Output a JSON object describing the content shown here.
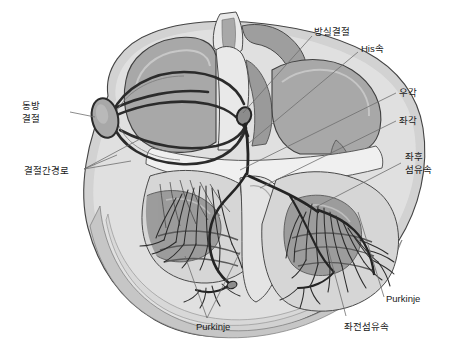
{
  "figure": {
    "width": 458,
    "height": 358,
    "background_color": "#ffffff",
    "style": "grayscale medical illustration"
  },
  "colors": {
    "background": "#ffffff",
    "outer_myocardium": "#d2d2d2",
    "mid_myocardium": "#c0c0c0",
    "endocardium_light": "#e8e8e8",
    "chamber_gray": "#a8a8a8",
    "chamber_dark": "#8f8f8f",
    "muscle_dark": "#9a9a9a",
    "outline": "#3a3a3a",
    "conduction_fiber": "#2b2b2b",
    "leader_line": "#6e6e6e",
    "label_text": "#1a1a1a"
  },
  "labels": [
    {
      "id": "sa-node",
      "text_line1": "동방",
      "text_line2": "결절",
      "x": 22,
      "y": 103,
      "align": "left",
      "leader_to_x": 95,
      "leader_to_y": 117
    },
    {
      "id": "internodal-pathway",
      "text_line1": "결절간경로",
      "text_line2": "",
      "x": 24,
      "y": 168,
      "align": "left",
      "leader_to_x": 130,
      "leader_to_y": 152
    },
    {
      "id": "av-node",
      "text_line1": "방실결절",
      "text_line2": "",
      "x": 314,
      "y": 27,
      "align": "left",
      "leader_to_x": 243,
      "leader_to_y": 113
    },
    {
      "id": "his-bundle",
      "text_line1": "His속",
      "text_line2": "",
      "x": 361,
      "y": 44,
      "align": "left",
      "leader_to_x": 248,
      "leader_to_y": 140
    },
    {
      "id": "right-bundle-branch",
      "text_line1": "우각",
      "text_line2": "",
      "x": 399,
      "y": 88,
      "align": "left",
      "leader_to_x": 243,
      "leader_to_y": 168
    },
    {
      "id": "left-bundle-branch",
      "text_line1": "좌각",
      "text_line2": "",
      "x": 399,
      "y": 116,
      "align": "left",
      "leader_to_x": 258,
      "leader_to_y": 186
    },
    {
      "id": "left-posterior-fascicle",
      "text_line1": "좌후",
      "text_line2": "섬유속",
      "x": 405,
      "y": 152,
      "align": "left",
      "leader_to_x": 318,
      "leader_to_y": 205
    },
    {
      "id": "purkinje-right",
      "text_line1": "Purkinje",
      "text_line2": "",
      "x": 386,
      "y": 294,
      "align": "left",
      "leader_to_x": 357,
      "leader_to_y": 213
    },
    {
      "id": "purkinje-left",
      "text_line1": "Purkinje",
      "text_line2": "",
      "x": 196,
      "y": 322,
      "align": "left",
      "leader_to_x": 207,
      "leader_to_y": 253
    },
    {
      "id": "left-anterior-fascicle",
      "text_line1": "좌전섬유속",
      "text_line2": "",
      "x": 344,
      "y": 322,
      "align": "left",
      "leader_to_x": 330,
      "leader_to_y": 248
    }
  ],
  "leaders": [
    {
      "id": "leader-sa-node",
      "points": "70,112 95,117"
    },
    {
      "id": "leader-internodal-a",
      "points": "84,169 117,155"
    },
    {
      "id": "leader-internodal-b",
      "points": "84,169 140,139"
    },
    {
      "id": "leader-internodal-c",
      "points": "84,169 131,160"
    },
    {
      "id": "leader-av-node",
      "points": "312,36 243,113"
    },
    {
      "id": "leader-his-bundle",
      "points": "358,52 249,143"
    },
    {
      "id": "leader-right-bundle",
      "points": "396,93 240,170"
    },
    {
      "id": "leader-left-bundle",
      "points": "396,121 260,188"
    },
    {
      "id": "leader-left-post-fascicle",
      "points": "401,163 316,207"
    },
    {
      "id": "leader-purkinje-right",
      "points": "384,297 358,212"
    },
    {
      "id": "leader-purkinje-left-a",
      "points": "207,318 185,256"
    },
    {
      "id": "leader-purkinje-left-b",
      "points": "207,318 240,252"
    },
    {
      "id": "leader-left-ant-fascicle",
      "points": "346,316 327,245"
    }
  ],
  "anatomy_parts": [
    "right-atrium",
    "left-atrium",
    "right-ventricle",
    "left-ventricle",
    "interatrial-septum",
    "interventricular-septum",
    "great-vessel-stumps",
    "papillary-muscles",
    "trabeculae-carneae",
    "myocardial-wall"
  ],
  "conduction_structures": [
    "sinoatrial-node",
    "internodal-pathways",
    "atrioventricular-node",
    "bundle-of-his",
    "right-bundle-branch",
    "left-bundle-branch",
    "left-anterior-fascicle",
    "left-posterior-fascicle",
    "purkinje-fibers"
  ]
}
